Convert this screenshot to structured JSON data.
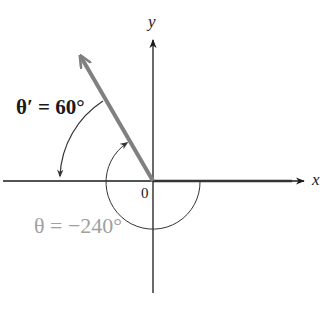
{
  "diagram": {
    "type": "angle-in-standard-position",
    "axes": {
      "x_label": "x",
      "y_label": "y",
      "origin_label": "0"
    },
    "reference_angle": {
      "label": "θ′ = 60°",
      "symbol": "θ′",
      "value_deg": 60
    },
    "angle": {
      "label": "θ = −240°",
      "symbol": "θ",
      "value_deg": -240
    },
    "colors": {
      "axis": "#1a1a1a",
      "terminal_ray": "#808080",
      "arc": "#333333",
      "faded_label": "#a0a0a0",
      "background": "#ffffff"
    }
  }
}
